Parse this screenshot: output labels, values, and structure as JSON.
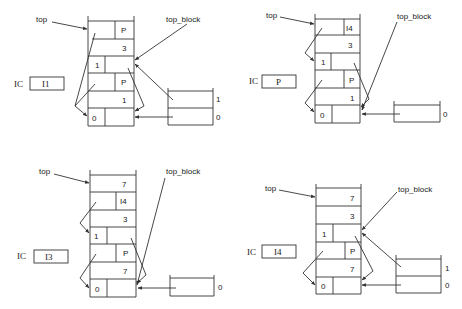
{
  "panels": [
    {
      "id": "panel-1",
      "labels": {
        "top": "top",
        "top_block": "top_block",
        "ic": "IC",
        "ic_value": "I1"
      },
      "stack": [
        {
          "left": "",
          "right": "P",
          "split": true
        },
        {
          "left": "",
          "right": "3",
          "split": false
        },
        {
          "left": "1",
          "right": "",
          "split": true,
          "leftNarrow": true
        },
        {
          "left": "",
          "right": "P",
          "split": true
        },
        {
          "left": "",
          "right": "1",
          "split": false
        },
        {
          "left": "0",
          "right": "",
          "split": true,
          "leftNarrow": true
        }
      ],
      "side_box": [
        "1",
        "0"
      ]
    },
    {
      "id": "panel-2",
      "labels": {
        "top": "top",
        "top_block": "top_block",
        "ic": "IC",
        "ic_value": "P"
      },
      "stack": [
        {
          "left": "",
          "right": "I4",
          "split": true
        },
        {
          "left": "",
          "right": "3",
          "split": false
        },
        {
          "left": "1",
          "right": "",
          "split": true,
          "leftNarrow": true
        },
        {
          "left": "",
          "right": "P",
          "split": true
        },
        {
          "left": "",
          "right": "1",
          "split": false
        },
        {
          "left": "0",
          "right": "",
          "split": true,
          "leftNarrow": true
        }
      ],
      "side_box": [
        "0"
      ]
    },
    {
      "id": "panel-3",
      "labels": {
        "top": "top",
        "top_block": "top_block",
        "ic": "IC",
        "ic_value": "I3"
      },
      "stack": [
        {
          "left": "",
          "right": "7",
          "split": false
        },
        {
          "left": "",
          "right": "I4",
          "split": true
        },
        {
          "left": "",
          "right": "3",
          "split": false
        },
        {
          "left": "1",
          "right": "",
          "split": true,
          "leftNarrow": true
        },
        {
          "left": "",
          "right": "P",
          "split": true
        },
        {
          "left": "",
          "right": "7",
          "split": false
        },
        {
          "left": "0",
          "right": "",
          "split": true,
          "leftNarrow": true
        }
      ],
      "side_box": [
        "0"
      ]
    },
    {
      "id": "panel-4",
      "labels": {
        "top": "top",
        "top_block": "top_block",
        "ic": "IC",
        "ic_value": "I4"
      },
      "stack": [
        {
          "left": "",
          "right": "7",
          "split": false
        },
        {
          "left": "",
          "right": "3",
          "split": false
        },
        {
          "left": "1",
          "right": "",
          "split": true,
          "leftNarrow": true
        },
        {
          "left": "",
          "right": "P",
          "split": true
        },
        {
          "left": "",
          "right": "7",
          "split": false
        },
        {
          "left": "0",
          "right": "",
          "split": true,
          "leftNarrow": true
        }
      ],
      "side_box": [
        "1",
        "0"
      ]
    }
  ]
}
